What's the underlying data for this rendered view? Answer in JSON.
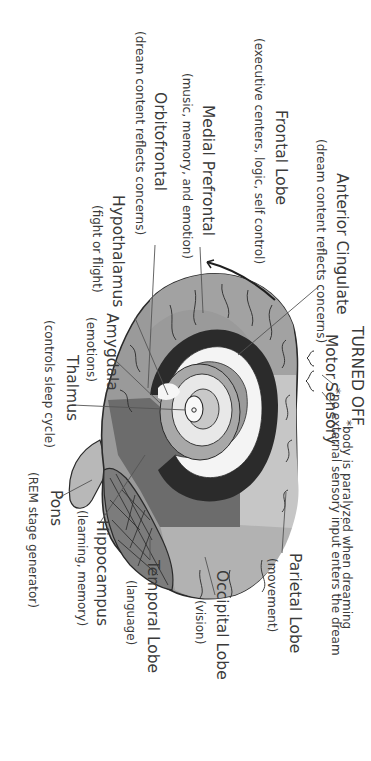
{
  "diagram": {
    "orientation": "rotated 90deg clockwise",
    "labels": {
      "anterior_cingulate": {
        "title": "Anterior Cingulate",
        "desc": "(dream content reflects concerns)"
      },
      "frontal_lobe": {
        "title": "Frontal Lobe",
        "desc": "(executive centers, logic, self control)"
      },
      "medial_prefrontal": {
        "title": "Medial Prefrontal",
        "desc": "(music, memory, and emotion)"
      },
      "orbitofrontal": {
        "title": "Orbitofrontal",
        "desc": "(dream content reflects concerns)"
      },
      "hypothalamus": {
        "title": "Hypothalamus",
        "desc": "(fight or flight)"
      },
      "amygdala": {
        "title": "Amygdala",
        "desc": "(emotions)"
      },
      "thalmus": {
        "title": "Thalmus",
        "desc": "(controls sleep cycle)"
      },
      "pons": {
        "title": "Pons",
        "desc": "(REM stage generator)"
      },
      "hippocampus": {
        "title": "Hippocampus",
        "desc": "(learning, memory)"
      },
      "temporal_lobe": {
        "title": "Temporal Lobe",
        "desc": "(language)"
      },
      "occipital_lobe": {
        "title": "Occipital Lobe",
        "desc": "(vision)"
      },
      "parietal_lobe": {
        "title": "Parietal Lobe",
        "desc": "(movement)"
      },
      "turned_off": {
        "title": "TURNED OFF",
        "motor": "Motor",
        "sensory": "Sensory",
        "motor_note": "*body is paralyzed when dreaming",
        "sensory_note": "*no external sensory input enters the dream"
      }
    },
    "colors": {
      "outline": "#2a2a2a",
      "frontal": "#9a9a9a",
      "prefrontal": "#8a8a8a",
      "parietal": "#c4c4c4",
      "occipital": "#b0b0b0",
      "temporal": "#6e6e6e",
      "cerebellum": "#7a7a7a",
      "ventricle_dark": "#2b2b2b",
      "white_matter": "#f4f4f4",
      "text": "#3a3a3a"
    }
  }
}
